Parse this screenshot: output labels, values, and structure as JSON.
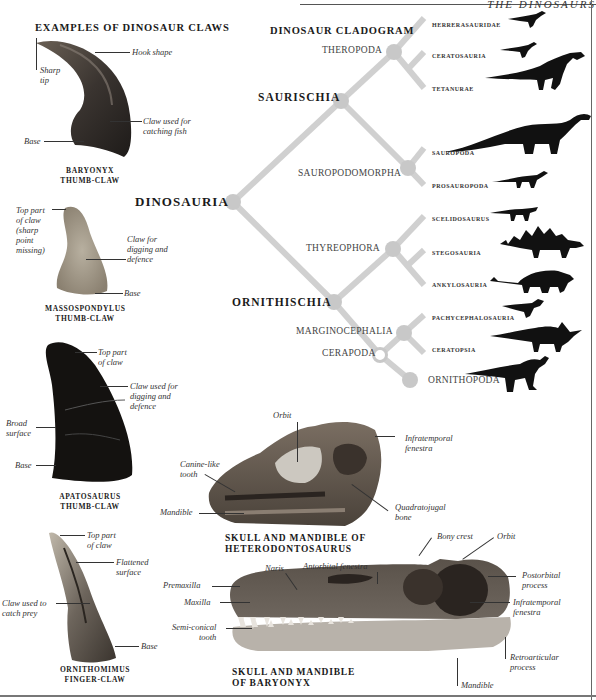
{
  "page": {
    "running_head": "THE DINOSAURS"
  },
  "claws": {
    "title": "EXAMPLES OF DINOSAUR CLAWS",
    "items": [
      {
        "caption": [
          "BARYONYX",
          "THUMB-CLAW"
        ],
        "labels": {
          "hook": "Hook shape",
          "tip": [
            "Sharp",
            "tip"
          ],
          "use": [
            "Claw used for",
            "catching fish"
          ],
          "base": "Base"
        }
      },
      {
        "caption": [
          "MASSOSPONDYLUS",
          "THUMB-CLAW"
        ],
        "labels": {
          "top": [
            "Top part",
            "of claw",
            "(sharp",
            "point",
            "missing)"
          ],
          "use": [
            "Claw for",
            "digging and",
            "defence"
          ],
          "base": "Base"
        }
      },
      {
        "caption": [
          "APATOSAURUS",
          "THUMB-CLAW"
        ],
        "labels": {
          "top": [
            "Top part",
            "of claw"
          ],
          "use": [
            "Claw used for",
            "digging and",
            "defence"
          ],
          "surface": [
            "Broad",
            "surface"
          ],
          "base": "Base"
        }
      },
      {
        "caption": [
          "ORNITHOMIMUS",
          "FINGER-CLAW"
        ],
        "labels": {
          "top": [
            "Top part",
            "of claw"
          ],
          "flat": [
            "Flattened",
            "surface"
          ],
          "use": [
            "Claw used to",
            "catch prey"
          ],
          "base": "Base"
        }
      }
    ]
  },
  "cladogram": {
    "title": "DINOSAUR CLADOGRAM",
    "root": "DINOSAURIA",
    "major": [
      "SAURISCHIA",
      "ORNITHISCHIA"
    ],
    "intermediate": [
      "THEROPODA",
      "SAUROPODOMORPHA",
      "THYREOPHORA",
      "MARGINOCEPHALIA",
      "CERAPODA"
    ],
    "terminals": [
      "HERRERASAURIDAE",
      "CERATOSAURIA",
      "TETANURAE",
      "SAUROPODA",
      "PROSAUROPODA",
      "SCELIDOSAURUS",
      "STEGOSAURIA",
      "ANKYLOSAURIA",
      "PACHYCEPHALOSAURIA",
      "CERATOPSIA",
      "ORNITHOPODA"
    ],
    "node_color": "#c8c8c8"
  },
  "skulls": [
    {
      "caption": [
        "SKULL AND MANDIBLE OF",
        "HETERODONTOSAURUS"
      ],
      "labels": {
        "orbit": "Orbit",
        "infratemporal": [
          "Infratemporal",
          "fenestra"
        ],
        "canine": [
          "Canine-like",
          "tooth"
        ],
        "mandible": "Mandible",
        "quadratojugal": [
          "Quadratojugal",
          "bone"
        ]
      }
    },
    {
      "caption": [
        "SKULL AND MANDIBLE",
        "OF BARYONYX"
      ],
      "labels": {
        "crest": "Bony crest",
        "orbit": "Orbit",
        "naris": "Naris",
        "antorbital": "Antorbital fenestra",
        "premaxilla": "Premaxilla",
        "maxilla": "Maxilla",
        "semiconical": [
          "Semi-conical",
          "tooth"
        ],
        "postorbital": [
          "Postorbital",
          "process"
        ],
        "infratemporal": [
          "Infratemporal",
          "fenestra"
        ],
        "retroarticular": [
          "Retroarticular",
          "process"
        ],
        "mandible": "Mandible"
      }
    }
  ]
}
